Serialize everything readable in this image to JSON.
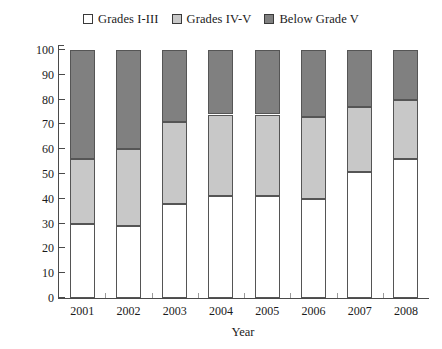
{
  "chart_data": {
    "type": "bar",
    "subtype": "stacked-percentage-column",
    "title": "",
    "xlabel": "Year",
    "ylabel": "Section percentage (%)",
    "categories": [
      "2001",
      "2002",
      "2003",
      "2004",
      "2005",
      "2006",
      "2007",
      "2008"
    ],
    "ylim": [
      0,
      100
    ],
    "yticks": [
      0,
      10,
      20,
      30,
      40,
      50,
      60,
      70,
      80,
      90,
      100
    ],
    "grid": false,
    "legend_position": "top-center",
    "stacked_total": 100,
    "series": [
      {
        "name": "Grades I-III",
        "color": "#ffffff",
        "values": [
          30,
          29,
          38,
          41,
          41,
          40,
          51,
          56
        ]
      },
      {
        "name": "Grades IV-V",
        "color": "#c8c8c8",
        "values": [
          26,
          31,
          33,
          33,
          33,
          33,
          26,
          24
        ]
      },
      {
        "name": "Below Grade V",
        "color": "#808080",
        "values": [
          44,
          40,
          29,
          26,
          26,
          27,
          23,
          20
        ]
      }
    ],
    "cumulative_boundaries": {
      "2001": [
        30,
        56
      ],
      "2002": [
        29,
        60
      ],
      "2003": [
        38,
        71
      ],
      "2004": [
        41,
        74
      ],
      "2005": [
        41,
        74
      ],
      "2006": [
        40,
        73
      ],
      "2007": [
        51,
        77
      ],
      "2008": [
        56,
        80
      ]
    }
  },
  "legend": {
    "items": [
      {
        "label": "Grades I-III",
        "color": "#ffffff"
      },
      {
        "label": "Grades IV-V",
        "color": "#c8c8c8"
      },
      {
        "label": "Below Grade V",
        "color": "#808080"
      }
    ]
  },
  "axes": {
    "y_title": "Section percentage (%)",
    "x_title": "Year",
    "y_tick_labels": [
      "100",
      "90",
      "80",
      "70",
      "60",
      "50",
      "40",
      "30",
      "20",
      "10",
      "0"
    ],
    "x_tick_labels": [
      "2001",
      "2002",
      "2003",
      "2004",
      "2005",
      "2006",
      "2007",
      "2008"
    ]
  },
  "colors": {
    "axis": "#4a4a4a",
    "bar_outline": "#555555",
    "background": "#ffffff",
    "series_white": "#ffffff",
    "series_light_gray": "#c8c8c8",
    "series_dark_gray": "#808080"
  }
}
